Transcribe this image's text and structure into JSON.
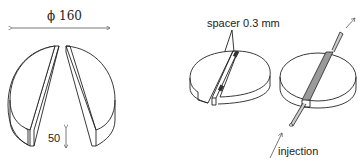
{
  "figure": {
    "left_panel": {
      "diameter_label": "ϕ 160",
      "thickness_label": "50"
    },
    "middle_panel": {
      "spacer_label": "spacer 0.3 mm"
    },
    "right_panel": {
      "injection_label": "injection",
      "channel_color": "#9a9a9a"
    }
  }
}
